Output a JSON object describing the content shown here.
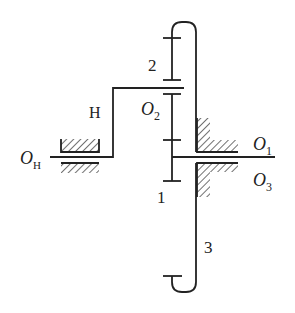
{
  "diagram": {
    "stroke_color": "#222222",
    "labels": {
      "gear_2": "2",
      "carrier": "H",
      "planet_axis": "O",
      "planet_axis_sub": "2",
      "carrier_axis": "O",
      "carrier_axis_sub": "H",
      "sun_axis": "O",
      "sun_axis_sub": "1",
      "ring_axis": "O",
      "ring_axis_sub": "3",
      "gear_1": "1",
      "gear_3": "3"
    },
    "components": [
      {
        "id": "1",
        "type": "sun-gear"
      },
      {
        "id": "2",
        "type": "planet-gear"
      },
      {
        "id": "3",
        "type": "ring-gear"
      },
      {
        "id": "H",
        "type": "carrier"
      }
    ]
  }
}
